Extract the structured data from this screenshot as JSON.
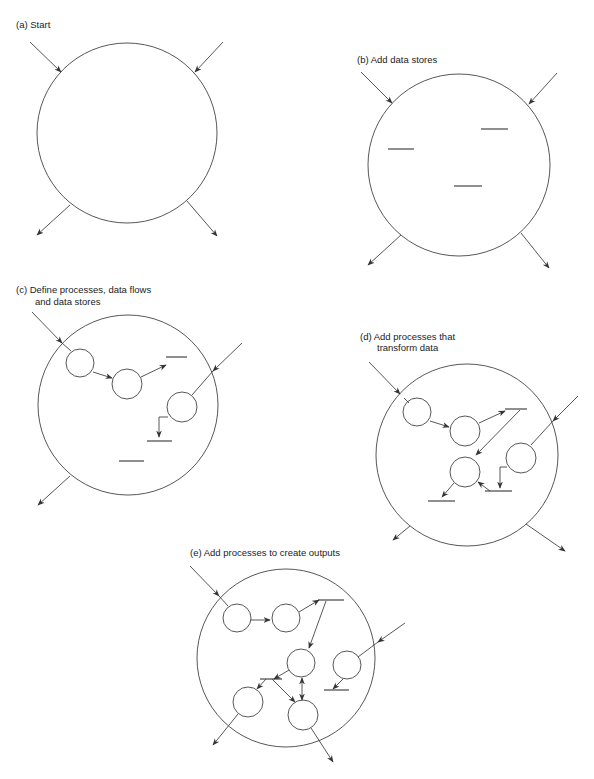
{
  "figure": {
    "panels": [
      {
        "id": "a",
        "label": "(a) Start"
      },
      {
        "id": "b",
        "label": "(b) Add data stores"
      },
      {
        "id": "c",
        "label_line1": "(c) Define processes, data flows",
        "label_line2": "and data stores"
      },
      {
        "id": "d",
        "label_line1": "(d) Add processes that",
        "label_line2": "transform data"
      },
      {
        "id": "e",
        "label": "(e) Add processes to create outputs"
      }
    ]
  },
  "colors": {
    "stroke": "#444444",
    "background": "#ffffff"
  }
}
